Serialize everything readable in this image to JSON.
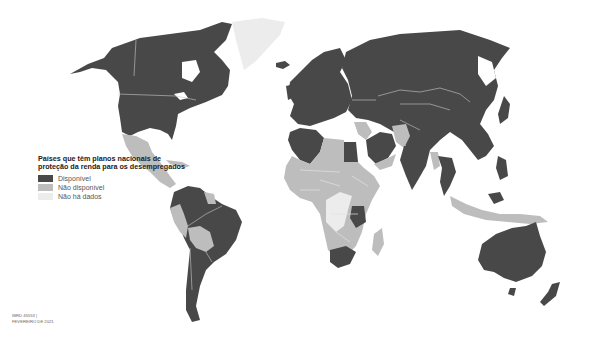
{
  "map": {
    "type": "choropleth",
    "projection": "world (Robinson-like)",
    "legend": {
      "title": "Países que têm planos nacionais de proteção da renda para os desempregados",
      "items": [
        {
          "key": "avail",
          "label": "Disponível",
          "color": "#484848"
        },
        {
          "key": "unavail",
          "label": "Não disponível",
          "color": "#bdbdbd"
        },
        {
          "key": "nodata",
          "label": "Não há dados",
          "color": "#ececec"
        }
      ]
    },
    "credits": {
      "line1": "IBRD 45553 |",
      "line2": "FEVEREIRO DE 2021"
    },
    "regions": {
      "avail": [
        "United States",
        "Canada",
        "Alaska",
        "Colombia",
        "Venezuela",
        "Ecuador",
        "Brazil",
        "Argentina",
        "Chile",
        "Uruguay",
        "Europe",
        "Russia",
        "Kazakhstan",
        "Mongolia",
        "China",
        "Japan",
        "Turkey",
        "Iran",
        "Saudi Arabia",
        "Egypt",
        "Algeria",
        "Morocco",
        "Tunisia",
        "India",
        "Thailand",
        "Vietnam",
        "Malaysia",
        "Philippines",
        "South Korea",
        "Australia",
        "New Zealand",
        "Tanzania",
        "South Africa",
        "Iceland"
      ],
      "unavail": [
        "Mexico",
        "Central America",
        "Caribbean",
        "Peru",
        "Bolivia",
        "Paraguay",
        "Guyana",
        "Suriname",
        "Libya",
        "West Africa",
        "Sudan",
        "Ethiopia",
        "Somalia",
        "Kenya",
        "Angola",
        "Zambia",
        "Mozambique",
        "Namibia",
        "Botswana",
        "Zimbabwe",
        "Madagascar",
        "Yemen",
        "Oman",
        "Afghanistan",
        "Pakistan",
        "Iraq",
        "Syria",
        "Myanmar",
        "Indonesia",
        "Papua New Guinea",
        "Balkans (part)"
      ],
      "nodata": [
        "Greenland",
        "DR Congo",
        "South Sudan",
        "Uganda (part)"
      ]
    }
  }
}
